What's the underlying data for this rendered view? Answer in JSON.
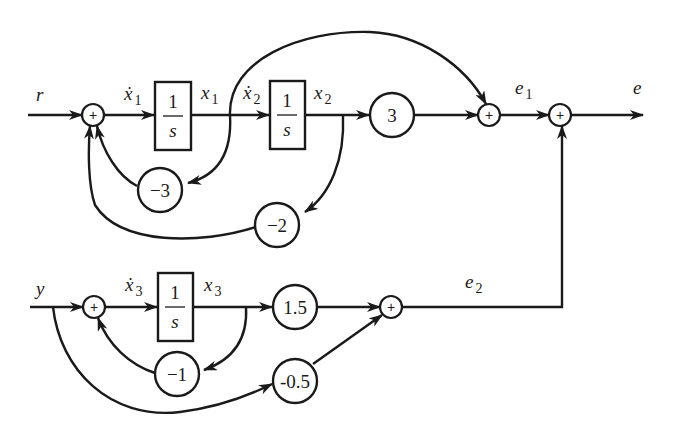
{
  "diagram": {
    "type": "block-diagram",
    "colors": {
      "line": "#1a1a1a",
      "background": "#ffffff"
    },
    "signals": {
      "r": "r",
      "y": "y",
      "e": "e",
      "x1dot": {
        "base": "ẋ",
        "sub": "1"
      },
      "x1": {
        "base": "x",
        "sub": "1"
      },
      "x2dot": {
        "base": "ẋ",
        "sub": "2"
      },
      "x2": {
        "base": "x",
        "sub": "2"
      },
      "x3dot": {
        "base": "ẋ",
        "sub": "3"
      },
      "x3": {
        "base": "x",
        "sub": "3"
      },
      "e1": {
        "base": "e",
        "sub": "1"
      },
      "e2": {
        "base": "e",
        "sub": "2"
      }
    },
    "integrators": [
      {
        "id": "int1",
        "num": "1",
        "den": "s"
      },
      {
        "id": "int2",
        "num": "1",
        "den": "s"
      },
      {
        "id": "int3",
        "num": "1",
        "den": "s"
      }
    ],
    "gains": {
      "g3": "3",
      "gm3": "−3",
      "gm2": "−2",
      "gm1": "−1",
      "g15": "1.5",
      "gm05": "-0.5"
    },
    "summing_junction_symbol": "+",
    "summers": [
      "sum1",
      "sum_e1",
      "sum_e",
      "sum3",
      "sum_e2"
    ]
  }
}
